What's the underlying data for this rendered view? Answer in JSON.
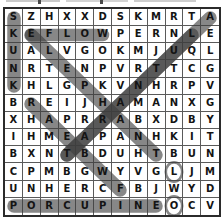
{
  "puzzle": {
    "type": "word-search",
    "rows": 12,
    "cols": 12,
    "grid": [
      [
        "S",
        "Z",
        "H",
        "X",
        "X",
        "D",
        "S",
        "K",
        "M",
        "R",
        "T",
        "A"
      ],
      [
        "K",
        "E",
        "F",
        "L",
        "O",
        "W",
        "P",
        "E",
        "R",
        "N",
        "L",
        "E"
      ],
      [
        "U",
        "A",
        "L",
        "V",
        "G",
        "O",
        "K",
        "M",
        "J",
        "U",
        "Q",
        "L"
      ],
      [
        "N",
        "R",
        "T",
        "E",
        "N",
        "P",
        "V",
        "R",
        "T",
        "T",
        "C",
        "G"
      ],
      [
        "K",
        "H",
        "L",
        "G",
        "P",
        "K",
        "V",
        "N",
        "H",
        "R",
        "P",
        "V"
      ],
      [
        "B",
        "R",
        "E",
        "I",
        "J",
        "H",
        "A",
        "M",
        "A",
        "N",
        "X",
        "G"
      ],
      [
        "X",
        "H",
        "A",
        "P",
        "R",
        "R",
        "A",
        "B",
        "X",
        "D",
        "B",
        "Y"
      ],
      [
        "I",
        "H",
        "M",
        "E",
        "A",
        "P",
        "A",
        "N",
        "H",
        "K",
        "I",
        "T"
      ],
      [
        "B",
        "X",
        "N",
        "T",
        "B",
        "D",
        "U",
        "H",
        "T",
        "B",
        "U",
        "N"
      ],
      [
        "C",
        "P",
        "M",
        "B",
        "G",
        "W",
        "Y",
        "V",
        "G",
        "L",
        "J",
        "M"
      ],
      [
        "U",
        "N",
        "H",
        "E",
        "R",
        "C",
        "F",
        "B",
        "J",
        "W",
        "Y",
        "D"
      ],
      [
        "P",
        "O",
        "R",
        "C",
        "U",
        "P",
        "I",
        "N",
        "E",
        "O",
        "C",
        "V"
      ]
    ],
    "found_words": [
      {
        "word": "SKUNK",
        "direction": "vertical-down",
        "start_row": 1,
        "start_col": 1,
        "end_row": 5,
        "end_col": 1
      },
      {
        "word": "EFLOW",
        "direction": "horizontal-right",
        "start_row": 2,
        "start_col": 2,
        "end_row": 2,
        "end_col": 6
      },
      {
        "word": "ELEPHANT",
        "direction": "diagonal-down-right",
        "start_row": 2,
        "start_col": 2,
        "end_row": 9,
        "end_col": 9
      },
      {
        "word": "RAMPART",
        "direction": "diagonal-down-right",
        "start_row": 6,
        "start_col": 2,
        "end_row": 11,
        "end_col": 7
      },
      {
        "word": "ALUTCHRAB",
        "direction": "diagonal-down-left",
        "start_row": 1,
        "start_col": 12,
        "end_row": 9,
        "end_col": 4
      },
      {
        "word": "LETTRANBT",
        "direction": "diagonal-down-left",
        "start_row": 2,
        "start_col": 11,
        "end_row": 9,
        "end_col": 4
      },
      {
        "word": "PORCUPINE",
        "direction": "horizontal-right",
        "start_row": 12,
        "start_col": 1,
        "end_row": 12,
        "end_col": 9
      },
      {
        "word": "L",
        "direction": "single",
        "start_row": 10,
        "start_col": 10,
        "end_row": 10,
        "end_col": 10
      },
      {
        "word": "O",
        "direction": "single",
        "start_row": 12,
        "start_col": 10,
        "end_row": 12,
        "end_col": 10
      }
    ],
    "colors": {
      "grid_line": "#5a5a5a",
      "border": "#2b2b2b",
      "letter": "#141414",
      "highlight": "#3d3d3d",
      "background": "#ffffff"
    }
  }
}
